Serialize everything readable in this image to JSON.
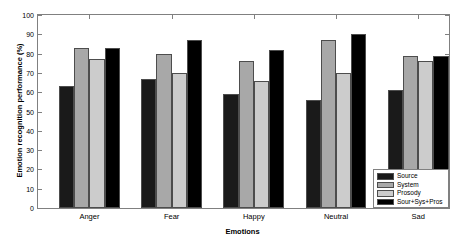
{
  "chart_data": {
    "type": "bar",
    "title": "",
    "xlabel": "Emotions",
    "ylabel": "Emotion recognition performance (%)",
    "categories": [
      "Anger",
      "Fear",
      "Happy",
      "Neutral",
      "Sad"
    ],
    "series": [
      {
        "name": "Source",
        "values": [
          63,
          67,
          59,
          56,
          61
        ],
        "color": "#1a1a1a"
      },
      {
        "name": "System",
        "values": [
          83,
          80,
          76,
          87,
          79
        ],
        "color": "#a8a8a8"
      },
      {
        "name": "Prosody",
        "values": [
          77,
          70,
          66,
          70,
          76
        ],
        "color": "#cccccc"
      },
      {
        "name": "Sour+Sys+Pros",
        "values": [
          83,
          87,
          82,
          90,
          79
        ],
        "color": "#000000"
      }
    ],
    "ylim": [
      0,
      100
    ],
    "yticks": [
      0,
      10,
      20,
      30,
      40,
      50,
      60,
      70,
      80,
      90,
      100
    ],
    "ytick_labels": [
      "0",
      "10",
      "20",
      "30",
      "40",
      "50",
      "60",
      "70",
      "80",
      "90",
      "100"
    ],
    "grid": false,
    "legend_position": "bottom-right",
    "legend_entries": [
      "Source",
      "System",
      "Prosody",
      "Sour+Sys+Pros"
    ],
    "axis_color": "#808080",
    "bar_edge_color": "#4d4d4d"
  }
}
